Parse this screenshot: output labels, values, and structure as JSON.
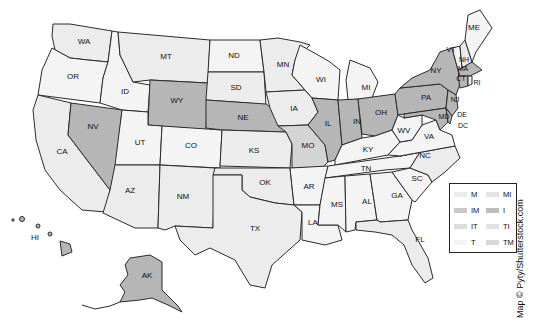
{
  "map": {
    "title": "",
    "colors": {
      "light": "#ececec",
      "lighter": "#f4f4f4",
      "medium": "#d4d4d4",
      "dark": "#b6b6b6",
      "stroke": "#2b2b2b"
    },
    "states": [
      {
        "code": "WA",
        "shade": "light"
      },
      {
        "code": "OR",
        "shade": "lighter"
      },
      {
        "code": "CA",
        "shade": "light"
      },
      {
        "code": "NV",
        "shade": "dark"
      },
      {
        "code": "ID",
        "shade": "lighter"
      },
      {
        "code": "MT",
        "shade": "light"
      },
      {
        "code": "WY",
        "shade": "dark"
      },
      {
        "code": "UT",
        "shade": "lighter"
      },
      {
        "code": "AZ",
        "shade": "light"
      },
      {
        "code": "CO",
        "shade": "lighter"
      },
      {
        "code": "NM",
        "shade": "light"
      },
      {
        "code": "ND",
        "shade": "lighter"
      },
      {
        "code": "SD",
        "shade": "light"
      },
      {
        "code": "NE",
        "shade": "dark"
      },
      {
        "code": "KS",
        "shade": "light"
      },
      {
        "code": "OK",
        "shade": "light"
      },
      {
        "code": "TX",
        "shade": "light"
      },
      {
        "code": "MN",
        "shade": "light"
      },
      {
        "code": "IA",
        "shade": "light"
      },
      {
        "code": "MO",
        "shade": "medium"
      },
      {
        "code": "AR",
        "shade": "lighter"
      },
      {
        "code": "LA",
        "shade": "lighter"
      },
      {
        "code": "WI",
        "shade": "lighter"
      },
      {
        "code": "IL",
        "shade": "dark"
      },
      {
        "code": "MI",
        "shade": "lighter"
      },
      {
        "code": "IN",
        "shade": "dark"
      },
      {
        "code": "OH",
        "shade": "dark"
      },
      {
        "code": "KY",
        "shade": "lighter"
      },
      {
        "code": "TN",
        "shade": "lighter"
      },
      {
        "code": "MS",
        "shade": "lighter"
      },
      {
        "code": "AL",
        "shade": "lighter"
      },
      {
        "code": "GA",
        "shade": "lighter"
      },
      {
        "code": "FL",
        "shade": "light"
      },
      {
        "code": "SC",
        "shade": "lighter"
      },
      {
        "code": "NC",
        "shade": "light"
      },
      {
        "code": "VA",
        "shade": "lighter"
      },
      {
        "code": "WV",
        "shade": "lighter"
      },
      {
        "code": "PA",
        "shade": "dark"
      },
      {
        "code": "NY",
        "shade": "dark"
      },
      {
        "code": "VT",
        "shade": "lighter"
      },
      {
        "code": "NH",
        "shade": "light"
      },
      {
        "code": "ME",
        "shade": "lighter"
      },
      {
        "code": "MA",
        "shade": "dark"
      },
      {
        "code": "CT",
        "shade": "dark"
      },
      {
        "code": "RI",
        "shade": "light"
      },
      {
        "code": "NJ",
        "shade": "dark"
      },
      {
        "code": "DE",
        "shade": "dark"
      },
      {
        "code": "MD",
        "shade": "dark"
      },
      {
        "code": "DC",
        "shade": "light"
      },
      {
        "code": "AK",
        "shade": "dark"
      },
      {
        "code": "HI",
        "shade": "dark"
      }
    ]
  },
  "labels": {
    "WA": "WA",
    "OR": "OR",
    "CA": "CA",
    "NV": "NV",
    "ID": "ID",
    "MT": "MT",
    "WY": "WY",
    "UT": "UT",
    "AZ": "AZ",
    "CO": "CO",
    "NM": "NM",
    "ND": "ND",
    "SD": "SD",
    "NE": "NE",
    "KS": "KS",
    "OK": "OK",
    "TX": "TX",
    "MN": "MN",
    "IA": "IA",
    "MO": "MO",
    "AR": "AR",
    "LA": "LA",
    "WI": "WI",
    "IL": "IL",
    "MI": "MI",
    "IN": "IN",
    "OH": "OH",
    "KY": "KY",
    "TN": "TN",
    "MS": "MS",
    "AL": "AL",
    "GA": "GA",
    "FL": "FL",
    "SC": "SC",
    "NC": "NC",
    "VA": "VA",
    "WV": "WV",
    "PA": "PA",
    "NY": "NY",
    "VT": "VT",
    "NH": "NH",
    "ME": "ME",
    "MA": "MA",
    "CT": "CT",
    "RI": "RI",
    "NJ": "NJ",
    "DE": "DE",
    "MD": "MD",
    "DC": "DC",
    "AK": "AK",
    "HI": "HI"
  },
  "legend": {
    "items": [
      {
        "label": "M",
        "color": "#ececec"
      },
      {
        "label": "MI",
        "color": "#e4e4e4"
      },
      {
        "label": "IM",
        "color": "#c8c8c8"
      },
      {
        "label": "I",
        "color": "#bdbdbd"
      },
      {
        "label": "IT",
        "color": "#dcdcdc"
      },
      {
        "label": "TI",
        "color": "#e2e2e2"
      },
      {
        "label": "T",
        "color": "#f4f4f4"
      },
      {
        "label": "TM",
        "color": "#d8d8d8"
      }
    ]
  },
  "credit": "Map © Pyty/Shutterstock.com"
}
